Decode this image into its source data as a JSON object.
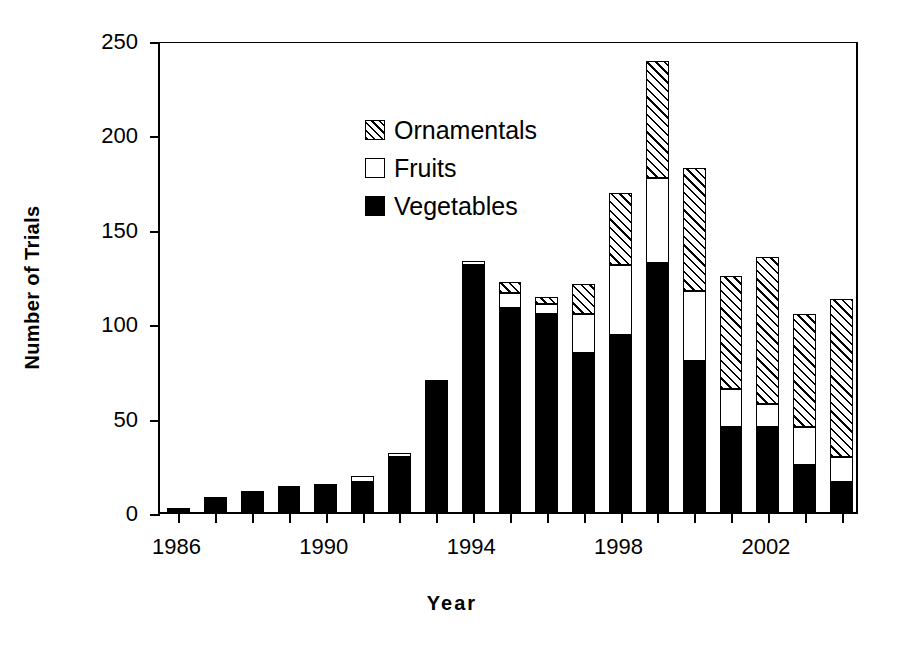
{
  "chart_data": {
    "type": "bar",
    "subtype": "stacked-vertical",
    "title": "",
    "xlabel": "Year",
    "ylabel": "Number of Trials",
    "ylim": [
      0,
      250
    ],
    "ytick_labels": [
      "0",
      "50",
      "100",
      "150",
      "200",
      "250"
    ],
    "ytick_values": [
      0,
      50,
      100,
      150,
      200,
      250
    ],
    "xtick_labels": [
      "1986",
      "1990",
      "1994",
      "1998",
      "2002"
    ],
    "xtick_values": [
      1986,
      1990,
      1994,
      1998,
      2002
    ],
    "grid": false,
    "legend_position": "top-left inside plot",
    "categories": [
      1986,
      1987,
      1988,
      1989,
      1990,
      1991,
      1992,
      1993,
      1994,
      1995,
      1996,
      1997,
      1998,
      1999,
      2000,
      2001,
      2002,
      2003,
      2004
    ],
    "series": [
      {
        "name": "Vegetables",
        "fill": "solid-black",
        "color": "#000000",
        "values": [
          2,
          8,
          11,
          14,
          15,
          16,
          29,
          70,
          131,
          108,
          105,
          84,
          94,
          132,
          80,
          45,
          45,
          25,
          16
        ]
      },
      {
        "name": "Fruits",
        "fill": "white",
        "color": "#ffffff",
        "values": [
          0,
          0,
          0,
          0,
          0,
          3,
          2,
          0,
          2,
          8,
          5,
          21,
          37,
          45,
          37,
          20,
          12,
          20,
          13
        ]
      },
      {
        "name": "Ornamentals",
        "fill": "hatched-diagonal",
        "color": "#000000",
        "values": [
          0,
          0,
          0,
          0,
          0,
          0,
          0,
          0,
          0,
          6,
          4,
          16,
          38,
          62,
          65,
          60,
          78,
          60,
          84
        ]
      }
    ],
    "totals": [
      2,
      8,
      11,
      14,
      15,
      19,
      31,
      70,
      133,
      122,
      114,
      121,
      169,
      239,
      182,
      125,
      135,
      105,
      113
    ]
  },
  "legend": {
    "items": [
      {
        "label": "Ornamentals",
        "swatch": "hatched-swatch"
      },
      {
        "label": "Fruits",
        "swatch": "white-swatch"
      },
      {
        "label": "Vegetables",
        "swatch": "black-swatch"
      }
    ]
  }
}
